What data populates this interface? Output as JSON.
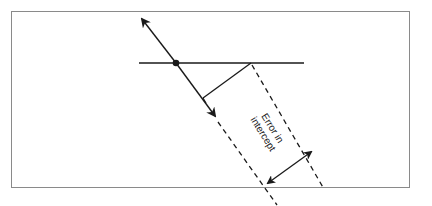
{
  "diagram": {
    "type": "geometric-error-illustration",
    "annotation": {
      "line1": "Error in",
      "line2": "intercept"
    },
    "colors": {
      "stroke": "#1a1a1a",
      "frame": "#8a8a8a",
      "background": "#ffffff"
    },
    "elements": [
      {
        "name": "horizontal-reference-line",
        "style": "solid"
      },
      {
        "name": "intersection-point",
        "style": "filled-dot"
      },
      {
        "name": "oblique-line-with-arrows",
        "style": "solid",
        "arrows": "both-ends"
      },
      {
        "name": "perpendicular-segment",
        "style": "solid"
      },
      {
        "name": "dashed-boundary-upper",
        "style": "dashed"
      },
      {
        "name": "dashed-boundary-lower",
        "style": "dashed"
      },
      {
        "name": "error-dimension-arrow",
        "style": "double-headed"
      }
    ]
  }
}
